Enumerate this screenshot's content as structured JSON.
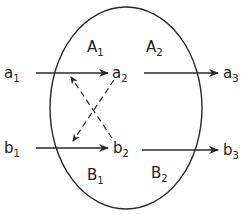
{
  "diagram": {
    "colors": {
      "stroke": "#2a2a2a",
      "background": "#ffffff",
      "text": "#222222"
    },
    "region": {
      "shape": "ellipse",
      "cx": 126,
      "cy": 108,
      "rx": 76,
      "ry": 101
    },
    "nodes": {
      "a1": {
        "base": "a",
        "sub": "1"
      },
      "a2": {
        "base": "a",
        "sub": "2"
      },
      "a3": {
        "base": "a",
        "sub": "3"
      },
      "b1": {
        "base": "b",
        "sub": "1"
      },
      "b2": {
        "base": "b",
        "sub": "2"
      },
      "b3": {
        "base": "b",
        "sub": "3"
      }
    },
    "regions_labels": {
      "A1": {
        "base": "A",
        "sub": "1"
      },
      "A2": {
        "base": "A",
        "sub": "2"
      },
      "B1": {
        "base": "B",
        "sub": "1"
      },
      "B2": {
        "base": "B",
        "sub": "2"
      }
    },
    "edges": [
      {
        "from": "a1",
        "to": "a2",
        "style": "solid"
      },
      {
        "from": "a2",
        "to": "a3",
        "style": "solid"
      },
      {
        "from": "b1",
        "to": "b2",
        "style": "solid"
      },
      {
        "from": "b2",
        "to": "b3",
        "style": "solid"
      },
      {
        "from": "a2",
        "to": "b1-side",
        "style": "dashed"
      },
      {
        "from": "b2",
        "to": "a1-side",
        "style": "dashed"
      }
    ]
  }
}
